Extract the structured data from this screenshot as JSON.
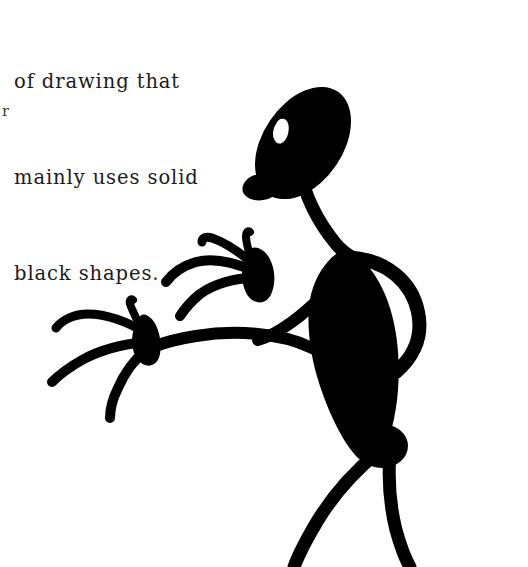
{
  "page": {
    "background_color": "#ffffff",
    "ink_color": "#000000",
    "width": 528,
    "height": 567
  },
  "caption": {
    "lines": [
      "of drawing that",
      "mainly uses solid",
      "black shapes."
    ],
    "line1": "of drawing that",
    "line2": "mainly uses solid",
    "line3": "black shapes.",
    "text_color": "#1a1a1a"
  },
  "margin_artifact": {
    "glyph": "r"
  },
  "figure": {
    "parts": [
      {
        "name": "head",
        "label": "head-oval",
        "fill": "#000000"
      },
      {
        "name": "eye",
        "label": "eye-crescent",
        "fill": "#ffffff"
      },
      {
        "name": "chin",
        "label": "chin-beak",
        "fill": "#000000"
      },
      {
        "name": "neck",
        "label": "neck-stroke",
        "fill": "#000000"
      },
      {
        "name": "torso",
        "label": "torso-teardrop",
        "fill": "#000000"
      },
      {
        "name": "right_arm",
        "label": "right-arm-loop",
        "fill": "#000000"
      },
      {
        "name": "upper_left_arm",
        "label": "upper-left-arm",
        "fill": "#000000"
      },
      {
        "name": "lower_left_arm",
        "label": "lower-left-arm",
        "fill": "#000000"
      },
      {
        "name": "upper_hand",
        "label": "upper-hand-fingers",
        "fingers": 4
      },
      {
        "name": "lower_hand",
        "label": "lower-hand-fingers",
        "fingers": 4
      },
      {
        "name": "left_leg",
        "label": "left-leg-stroke",
        "fill": "#000000"
      },
      {
        "name": "right_leg",
        "label": "right-leg-stroke",
        "fill": "#000000"
      }
    ]
  }
}
